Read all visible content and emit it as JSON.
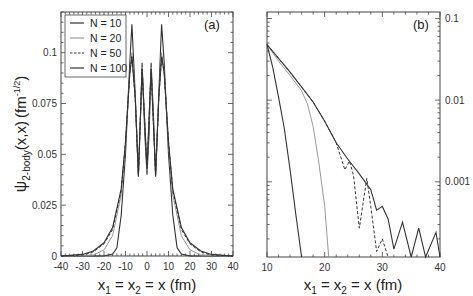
{
  "chart_data": [
    {
      "type": "line",
      "panel_label": "(a)",
      "xlabel": "x₁ = x₂ = x (fm)",
      "ylabel": "ψ₂-body(x,x) (fm^-1/2)",
      "xlim": [
        -40,
        40
      ],
      "ylim": [
        0,
        0.12
      ],
      "xticks": [
        "-40",
        "-30",
        "-20",
        "-10",
        "0",
        "10",
        "20",
        "30",
        "40"
      ],
      "yticks": [
        "0",
        "0.025",
        "0.05",
        "0.075",
        "0.1"
      ],
      "legend_position": "upper-left",
      "grid": false,
      "series": [
        {
          "name": "N = 10",
          "style": "solid-dark",
          "x": [
            -40,
            -20,
            -16,
            -14,
            -12,
            -10,
            -8,
            -7,
            -5.5,
            -4,
            -3,
            -2.3,
            -1,
            0,
            1,
            1.9,
            3,
            4,
            5.5,
            6.8,
            8,
            10,
            12,
            14,
            16,
            20,
            40
          ],
          "y": [
            0,
            0,
            0.001,
            0.004,
            0.02,
            0.05,
            0.095,
            0.114,
            0.08,
            0.039,
            0.07,
            0.095,
            0.06,
            0.04,
            0.06,
            0.095,
            0.07,
            0.039,
            0.08,
            0.114,
            0.095,
            0.05,
            0.02,
            0.004,
            0.001,
            0,
            0
          ]
        },
        {
          "name": "N = 20",
          "style": "solid-gray",
          "x": [
            -40,
            -25,
            -20,
            -16,
            -12,
            -10,
            -8,
            -7,
            -5.5,
            -4,
            -2.3,
            0,
            1.9,
            4,
            5.5,
            6.8,
            8,
            10,
            12,
            16,
            20,
            25,
            40
          ],
          "y": [
            0,
            0.0005,
            0.003,
            0.01,
            0.03,
            0.055,
            0.09,
            0.1,
            0.078,
            0.04,
            0.093,
            0.042,
            0.093,
            0.04,
            0.078,
            0.1,
            0.09,
            0.055,
            0.03,
            0.01,
            0.003,
            0.0005,
            0
          ]
        },
        {
          "name": "N = 50",
          "style": "dashed",
          "x": [
            -40,
            -30,
            -25,
            -20,
            -16,
            -12,
            -10,
            -8,
            -7,
            -5.5,
            -4,
            -2.3,
            0,
            1.9,
            4,
            5.5,
            6.8,
            8,
            10,
            12,
            16,
            20,
            25,
            30,
            40
          ],
          "y": [
            0,
            0.0005,
            0.002,
            0.006,
            0.013,
            0.032,
            0.056,
            0.09,
            0.098,
            0.078,
            0.04,
            0.092,
            0.043,
            0.092,
            0.04,
            0.078,
            0.098,
            0.09,
            0.056,
            0.032,
            0.013,
            0.006,
            0.002,
            0.0005,
            0
          ]
        },
        {
          "name": "N = 100",
          "style": "solid-dark",
          "x": [
            -40,
            -30,
            -25,
            -20,
            -16,
            -12,
            -10,
            -8,
            -7,
            -5.5,
            -4,
            -2.3,
            0,
            1.9,
            4,
            5.5,
            6.8,
            8,
            10,
            12,
            16,
            20,
            25,
            30,
            40
          ],
          "y": [
            0,
            0.0008,
            0.0025,
            0.0065,
            0.014,
            0.033,
            0.056,
            0.09,
            0.098,
            0.078,
            0.04,
            0.092,
            0.043,
            0.092,
            0.04,
            0.078,
            0.098,
            0.09,
            0.056,
            0.033,
            0.014,
            0.0065,
            0.0025,
            0.0008,
            0
          ]
        }
      ]
    },
    {
      "type": "line",
      "panel_label": "(b)",
      "xlabel": "x₁ = x₂ = x (fm)",
      "ylabel": "",
      "yscale": "log",
      "yaxis_side": "right",
      "xlim": [
        10,
        40
      ],
      "ylim": [
        0.00012,
        0.12
      ],
      "xticks": [
        "10",
        "20",
        "30",
        "40"
      ],
      "yticks": [
        "0.001",
        "0.01",
        "0.1"
      ],
      "grid": false,
      "series": [
        {
          "name": "N = 10",
          "style": "solid-dark",
          "x": [
            10,
            11,
            12,
            13,
            14,
            15,
            16
          ],
          "y": [
            0.048,
            0.025,
            0.011,
            0.0045,
            0.0014,
            0.0004,
            0.00012
          ]
        },
        {
          "name": "N = 20",
          "style": "solid-gray",
          "x": [
            10,
            12,
            14,
            16,
            17,
            18,
            19,
            20,
            20.7
          ],
          "y": [
            0.048,
            0.03,
            0.02,
            0.013,
            0.009,
            0.0048,
            0.0017,
            0.0005,
            0.00012
          ]
        },
        {
          "name": "N = 50",
          "style": "dashed",
          "x": [
            10,
            14,
            18,
            20,
            22,
            23.5,
            24.3,
            25,
            26,
            27.3,
            28,
            29,
            30,
            31
          ],
          "y": [
            0.048,
            0.022,
            0.0095,
            0.0055,
            0.003,
            0.0014,
            0.0018,
            0.0012,
            0.00027,
            0.0011,
            0.0005,
            0.00014,
            0.0002,
            0.00012
          ]
        },
        {
          "name": "N = 100",
          "style": "solid-dark",
          "x": [
            10,
            14,
            18,
            20,
            22,
            24,
            26,
            28,
            29,
            30,
            31,
            32,
            33.5,
            35,
            36.3,
            37.5,
            39.3,
            40
          ],
          "y": [
            0.048,
            0.022,
            0.0095,
            0.0055,
            0.003,
            0.0019,
            0.00125,
            0.0008,
            0.00045,
            0.0005,
            0.00035,
            0.00015,
            0.00032,
            0.00012,
            0.00027,
            0.00012,
            0.00024,
            0.00012
          ]
        }
      ]
    }
  ],
  "panel_a": {
    "label": "(a)",
    "xlabel_text": "x",
    "xlabel_parts": [
      "x",
      "1",
      " = x",
      "2",
      " = x (fm)"
    ],
    "ylabel_parts": [
      "ψ",
      "2-body",
      "(x,x)",
      "fm",
      "-1/2"
    ],
    "xticks": [
      "-40",
      "-30",
      "-20",
      "-10",
      "0",
      "10",
      "20",
      "30",
      "40"
    ],
    "yticks": [
      "0",
      "0.025",
      "0.05",
      "0.075",
      "0.1"
    ],
    "legend": [
      "N = 10",
      "N = 20",
      "N = 50",
      "N = 100"
    ]
  },
  "panel_b": {
    "label": "(b)",
    "xlabel_parts": [
      "x",
      "1",
      " = x",
      "2",
      " = x (fm)"
    ],
    "xticks": [
      "10",
      "20",
      "30",
      "40"
    ],
    "yticks": [
      "0.1",
      "0.01",
      "0.001"
    ]
  },
  "colors": {
    "dark": "#333333",
    "gray": "#999999",
    "axis": "#444444"
  }
}
